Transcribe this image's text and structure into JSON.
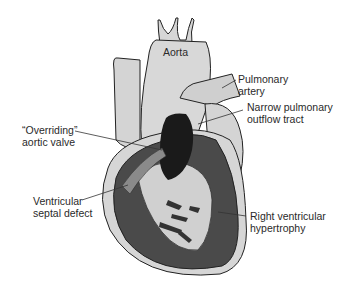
{
  "figure": {
    "type": "anatomical diagram",
    "colors": {
      "tissue_light": "#d2d2d2",
      "tissue_dark": "#4a4a4a",
      "outline": "#222222",
      "background": "#ffffff"
    }
  },
  "labels": {
    "aorta": {
      "text": "Aorta"
    },
    "pulmonary_artery": {
      "line1": "Pulmonary",
      "line2": "artery"
    },
    "narrow_outflow": {
      "line1": "Narrow pulmonary",
      "line2": "outflow tract"
    },
    "overriding_valve": {
      "line1": "“Overriding”",
      "line2": "aortic valve"
    },
    "vsd": {
      "line1": "Ventricular",
      "line2": "septal defect"
    },
    "rvh": {
      "line1": "Right ventricular",
      "line2": "hypertrophy"
    }
  }
}
